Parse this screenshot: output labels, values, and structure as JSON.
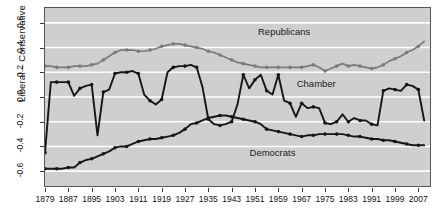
{
  "chart_data": {
    "type": "line",
    "title": "",
    "subtitle": "",
    "xlabel": "",
    "ylabel": "Liberal – Conservative",
    "xlim": [
      1879,
      2011
    ],
    "ylim": [
      -0.72,
      0.72
    ],
    "grid": true,
    "grid_color": "#ffffff",
    "plot_background": "#cfcfcf",
    "legend_position": "inline-annotations",
    "ytick_labels": [
      "-0.6",
      "-0.4",
      "-0.2",
      "0.0",
      "0.2",
      "0.4",
      "0.6"
    ],
    "ytick_values": [
      -0.6,
      -0.4,
      -0.2,
      0.0,
      0.2,
      0.4,
      0.6
    ],
    "xtick_labels": [
      "1879",
      "1887",
      "1895",
      "1903",
      "1911",
      "1919",
      "1927",
      "1935",
      "1943",
      "1951",
      "1959",
      "1967",
      "1975",
      "1983",
      "1991",
      "1999",
      "2007"
    ],
    "xtick_values": [
      1879,
      1887,
      1895,
      1903,
      1911,
      1919,
      1927,
      1935,
      1943,
      1951,
      1959,
      1967,
      1975,
      1983,
      1991,
      1999,
      2007
    ],
    "annotations": [
      {
        "text": "Republicans",
        "x": 1961,
        "y": 0.52
      },
      {
        "text": "Chamber",
        "x": 1972,
        "y": 0.1
      },
      {
        "text": "Democrats",
        "x": 1957,
        "y": -0.46
      }
    ],
    "series": [
      {
        "name": "Republicans",
        "color": "#7a7a7a",
        "marker": "circle",
        "x": [
          1879,
          1881,
          1883,
          1885,
          1887,
          1889,
          1891,
          1893,
          1895,
          1897,
          1899,
          1901,
          1903,
          1905,
          1907,
          1909,
          1911,
          1913,
          1915,
          1917,
          1919,
          1921,
          1923,
          1925,
          1927,
          1929,
          1931,
          1933,
          1935,
          1937,
          1939,
          1941,
          1943,
          1945,
          1947,
          1949,
          1951,
          1953,
          1955,
          1957,
          1959,
          1961,
          1963,
          1965,
          1967,
          1969,
          1971,
          1973,
          1975,
          1977,
          1979,
          1981,
          1983,
          1985,
          1987,
          1989,
          1991,
          1993,
          1995,
          1997,
          1999,
          2001,
          2003,
          2005,
          2007,
          2009
        ],
        "y": [
          0.25,
          0.25,
          0.24,
          0.24,
          0.24,
          0.25,
          0.25,
          0.25,
          0.26,
          0.27,
          0.3,
          0.33,
          0.36,
          0.38,
          0.38,
          0.38,
          0.37,
          0.37,
          0.38,
          0.39,
          0.41,
          0.42,
          0.43,
          0.43,
          0.42,
          0.41,
          0.4,
          0.39,
          0.37,
          0.36,
          0.34,
          0.32,
          0.3,
          0.28,
          0.27,
          0.26,
          0.25,
          0.24,
          0.24,
          0.24,
          0.24,
          0.24,
          0.24,
          0.24,
          0.24,
          0.25,
          0.26,
          0.24,
          0.21,
          0.23,
          0.25,
          0.27,
          0.25,
          0.26,
          0.25,
          0.24,
          0.23,
          0.24,
          0.26,
          0.29,
          0.31,
          0.33,
          0.36,
          0.38,
          0.41,
          0.45
        ]
      },
      {
        "name": "Democrats",
        "color": "#161616",
        "marker": "circle",
        "x": [
          1879,
          1881,
          1883,
          1885,
          1887,
          1889,
          1891,
          1893,
          1895,
          1897,
          1899,
          1901,
          1903,
          1905,
          1907,
          1909,
          1911,
          1913,
          1915,
          1917,
          1919,
          1921,
          1923,
          1925,
          1927,
          1929,
          1931,
          1933,
          1935,
          1937,
          1939,
          1941,
          1943,
          1945,
          1947,
          1949,
          1951,
          1953,
          1955,
          1957,
          1959,
          1961,
          1963,
          1965,
          1967,
          1969,
          1971,
          1973,
          1975,
          1977,
          1979,
          1981,
          1983,
          1985,
          1987,
          1989,
          1991,
          1993,
          1995,
          1997,
          1999,
          2001,
          2003,
          2005,
          2007,
          2009
        ],
        "y": [
          -0.58,
          -0.58,
          -0.58,
          -0.58,
          -0.57,
          -0.57,
          -0.53,
          -0.51,
          -0.5,
          -0.48,
          -0.46,
          -0.44,
          -0.41,
          -0.4,
          -0.4,
          -0.38,
          -0.36,
          -0.35,
          -0.34,
          -0.34,
          -0.33,
          -0.32,
          -0.31,
          -0.29,
          -0.26,
          -0.22,
          -0.21,
          -0.19,
          -0.17,
          -0.16,
          -0.15,
          -0.15,
          -0.16,
          -0.17,
          -0.18,
          -0.19,
          -0.2,
          -0.22,
          -0.26,
          -0.27,
          -0.28,
          -0.29,
          -0.3,
          -0.31,
          -0.32,
          -0.31,
          -0.31,
          -0.3,
          -0.3,
          -0.3,
          -0.3,
          -0.3,
          -0.31,
          -0.32,
          -0.32,
          -0.33,
          -0.34,
          -0.34,
          -0.35,
          -0.35,
          -0.36,
          -0.37,
          -0.38,
          -0.39,
          -0.39,
          -0.39
        ]
      },
      {
        "name": "Chamber",
        "color": "#161616",
        "marker": "circle",
        "x": [
          1879,
          1881,
          1883,
          1885,
          1887,
          1889,
          1891,
          1893,
          1895,
          1897,
          1899,
          1901,
          1903,
          1905,
          1907,
          1909,
          1911,
          1913,
          1915,
          1917,
          1919,
          1921,
          1923,
          1925,
          1927,
          1929,
          1931,
          1933,
          1935,
          1937,
          1939,
          1941,
          1943,
          1945,
          1947,
          1949,
          1951,
          1953,
          1955,
          1957,
          1959,
          1961,
          1963,
          1965,
          1967,
          1969,
          1971,
          1973,
          1975,
          1977,
          1979,
          1981,
          1983,
          1985,
          1987,
          1989,
          1991,
          1993,
          1995,
          1997,
          1999,
          2001,
          2003,
          2005,
          2007,
          2009
        ],
        "y": [
          -0.45,
          0.12,
          0.12,
          0.12,
          0.12,
          0.01,
          0.07,
          0.09,
          0.1,
          -0.31,
          0.04,
          0.06,
          0.19,
          0.2,
          0.2,
          0.21,
          0.19,
          0.02,
          -0.03,
          -0.06,
          -0.02,
          0.2,
          0.24,
          0.25,
          0.25,
          0.26,
          0.24,
          0.08,
          -0.18,
          -0.22,
          -0.23,
          -0.22,
          -0.2,
          -0.06,
          0.18,
          0.07,
          0.14,
          0.18,
          0.05,
          0.02,
          0.18,
          -0.03,
          -0.05,
          -0.16,
          -0.05,
          -0.09,
          -0.08,
          -0.09,
          -0.21,
          -0.22,
          -0.2,
          -0.14,
          -0.2,
          -0.17,
          -0.19,
          -0.19,
          -0.22,
          -0.23,
          0.05,
          0.07,
          0.06,
          0.05,
          0.1,
          0.09,
          0.06,
          -0.19
        ]
      }
    ]
  }
}
